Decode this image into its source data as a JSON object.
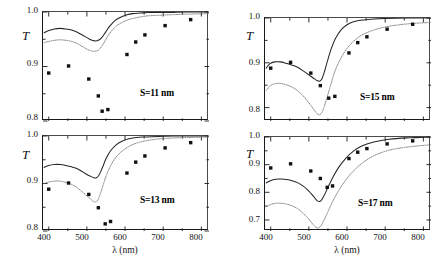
{
  "figure": {
    "axis_titles": {
      "y": "T",
      "x": "λ (nm)"
    },
    "panels": [
      {
        "id": "s11",
        "annotation": "S=11 nm",
        "xlim": [
          385,
          820
        ],
        "ylim": [
          0.8,
          1.0
        ],
        "yticks": [
          0.8,
          0.9,
          1.0
        ],
        "ytick_labels": [
          "0.8",
          "0.9",
          "1.0"
        ],
        "xticks": [
          400,
          450,
          500,
          550,
          600,
          650,
          700,
          750,
          800
        ],
        "xtick_labels": [
          "400",
          "",
          "500",
          "",
          "600",
          "",
          "700",
          "",
          "800"
        ],
        "show_xlabels": false
      },
      {
        "id": "s15",
        "annotation": "S=15 nm",
        "xlim": [
          385,
          820
        ],
        "ylim": [
          0.77,
          1.0
        ],
        "yticks": [
          0.8,
          0.9,
          1.0
        ],
        "ytick_labels": [
          "0.8",
          "0.9",
          "1.0"
        ],
        "xticks": [
          400,
          450,
          500,
          550,
          600,
          650,
          700,
          750,
          800
        ],
        "xtick_labels": [
          "400",
          "",
          "500",
          "",
          "600",
          "",
          "700",
          "",
          "800"
        ],
        "show_xlabels": false
      },
      {
        "id": "s13",
        "annotation": "S=13 nm",
        "xlim": [
          385,
          820
        ],
        "ylim": [
          0.8,
          1.0
        ],
        "yticks": [
          0.8,
          0.9,
          1.0
        ],
        "ytick_labels": [
          "0.8",
          "0.9",
          "1.0"
        ],
        "xticks": [
          400,
          450,
          500,
          550,
          600,
          650,
          700,
          750,
          800
        ],
        "xtick_labels": [
          "400",
          "",
          "500",
          "",
          "600",
          "",
          "700",
          "",
          "800"
        ],
        "show_xlabels": true
      },
      {
        "id": "s17",
        "annotation": "S=17 nm",
        "xlim": [
          385,
          820
        ],
        "ylim": [
          0.66,
          1.0
        ],
        "yticks": [
          0.7,
          0.8,
          0.9,
          1.0
        ],
        "ytick_labels": [
          "0.7",
          "0.8",
          "0.9",
          "1.0"
        ],
        "xticks": [
          400,
          450,
          500,
          550,
          600,
          650,
          700,
          750,
          800
        ],
        "xtick_labels": [
          "400",
          "",
          "500",
          "",
          "600",
          "",
          "700",
          "",
          "800"
        ],
        "show_xlabels": true
      }
    ]
  },
  "chart_data": [
    {
      "type": "line",
      "id": "s11",
      "title": "S=11 nm",
      "xlabel": "λ (nm)",
      "ylabel": "T",
      "xlim": [
        385,
        820
      ],
      "ylim": [
        0.8,
        1.0
      ],
      "grid": false,
      "legend": "none",
      "series": [
        {
          "name": "theory-solid",
          "style": "solid",
          "color": "#262626",
          "x": [
            388,
            400,
            415,
            430,
            445,
            460,
            475,
            490,
            500,
            510,
            520,
            530,
            540,
            550,
            560,
            575,
            590,
            605,
            620,
            640,
            660,
            690,
            720,
            760,
            820
          ],
          "y": [
            0.962,
            0.966,
            0.969,
            0.97,
            0.969,
            0.967,
            0.963,
            0.957,
            0.953,
            0.949,
            0.947,
            0.948,
            0.954,
            0.964,
            0.974,
            0.985,
            0.991,
            0.995,
            0.997,
            0.998,
            0.999,
            0.999,
            0.999,
            1.0,
            1.0
          ]
        },
        {
          "name": "theory-dotted",
          "style": "dotted",
          "color": "#707070",
          "x": [
            388,
            400,
            415,
            430,
            445,
            460,
            475,
            490,
            500,
            510,
            520,
            530,
            540,
            550,
            560,
            575,
            590,
            605,
            620,
            640,
            660,
            690,
            720,
            760,
            820
          ],
          "y": [
            0.944,
            0.946,
            0.948,
            0.949,
            0.948,
            0.946,
            0.942,
            0.936,
            0.932,
            0.929,
            0.928,
            0.93,
            0.938,
            0.95,
            0.961,
            0.973,
            0.98,
            0.985,
            0.988,
            0.991,
            0.993,
            0.994,
            0.995,
            0.996,
            0.997
          ]
        },
        {
          "name": "experiment-points",
          "style": "markers",
          "marker": "square",
          "color": "#111111",
          "x": [
            400,
            452,
            505,
            530,
            540,
            555,
            605,
            628,
            652,
            705,
            772
          ],
          "y": [
            0.888,
            0.901,
            0.877,
            0.846,
            0.818,
            0.821,
            0.922,
            0.945,
            0.958,
            0.975,
            0.986
          ]
        }
      ]
    },
    {
      "type": "line",
      "id": "s15",
      "title": "S=15 nm",
      "xlabel": "λ (nm)",
      "ylabel": "T",
      "xlim": [
        385,
        820
      ],
      "ylim": [
        0.77,
        1.0
      ],
      "grid": false,
      "legend": "none",
      "series": [
        {
          "name": "theory-solid",
          "style": "solid",
          "color": "#262626",
          "x": [
            388,
            398,
            410,
            425,
            440,
            455,
            470,
            485,
            495,
            505,
            515,
            522,
            528,
            534,
            540,
            548,
            558,
            570,
            585,
            600,
            615,
            635,
            660,
            700,
            760,
            820
          ],
          "y": [
            0.888,
            0.898,
            0.902,
            0.902,
            0.899,
            0.895,
            0.89,
            0.882,
            0.876,
            0.87,
            0.864,
            0.86,
            0.859,
            0.864,
            0.878,
            0.902,
            0.93,
            0.955,
            0.974,
            0.985,
            0.991,
            0.995,
            0.997,
            0.999,
            1.0,
            1.0
          ]
        },
        {
          "name": "theory-dotted",
          "style": "dotted",
          "color": "#707070",
          "x": [
            388,
            398,
            410,
            425,
            440,
            455,
            470,
            485,
            495,
            505,
            515,
            522,
            528,
            534,
            540,
            548,
            558,
            570,
            585,
            600,
            615,
            635,
            660,
            700,
            760,
            820
          ],
          "y": [
            0.838,
            0.848,
            0.853,
            0.854,
            0.851,
            0.846,
            0.838,
            0.826,
            0.816,
            0.805,
            0.793,
            0.786,
            0.784,
            0.789,
            0.802,
            0.824,
            0.853,
            0.885,
            0.912,
            0.932,
            0.946,
            0.96,
            0.97,
            0.98,
            0.987,
            0.99
          ]
        },
        {
          "name": "experiment-points",
          "style": "markers",
          "marker": "square",
          "color": "#111111",
          "x": [
            400,
            452,
            505,
            530,
            552,
            568,
            605,
            628,
            652,
            705,
            772
          ],
          "y": [
            0.888,
            0.901,
            0.877,
            0.849,
            0.821,
            0.825,
            0.922,
            0.945,
            0.958,
            0.975,
            0.986
          ]
        }
      ]
    },
    {
      "type": "line",
      "id": "s13",
      "title": "S=13 nm",
      "xlabel": "λ (nm)",
      "ylabel": "T",
      "xlim": [
        385,
        820
      ],
      "ylim": [
        0.8,
        1.0
      ],
      "grid": false,
      "legend": "none",
      "series": [
        {
          "name": "theory-solid",
          "style": "solid",
          "color": "#262626",
          "x": [
            388,
            400,
            415,
            430,
            445,
            460,
            475,
            490,
            500,
            510,
            518,
            525,
            532,
            540,
            550,
            562,
            576,
            592,
            610,
            630,
            655,
            690,
            730,
            780,
            820
          ],
          "y": [
            0.934,
            0.938,
            0.94,
            0.94,
            0.938,
            0.935,
            0.931,
            0.924,
            0.919,
            0.915,
            0.912,
            0.912,
            0.918,
            0.932,
            0.952,
            0.969,
            0.981,
            0.989,
            0.994,
            0.997,
            0.998,
            0.999,
            1.0,
            1.0,
            1.0
          ]
        },
        {
          "name": "theory-dotted",
          "style": "dotted",
          "color": "#707070",
          "x": [
            388,
            400,
            415,
            430,
            445,
            460,
            475,
            490,
            500,
            510,
            518,
            525,
            532,
            540,
            550,
            562,
            576,
            592,
            610,
            630,
            655,
            690,
            730,
            780,
            820
          ],
          "y": [
            0.9,
            0.903,
            0.905,
            0.905,
            0.902,
            0.898,
            0.891,
            0.881,
            0.874,
            0.867,
            0.862,
            0.862,
            0.871,
            0.89,
            0.915,
            0.937,
            0.955,
            0.968,
            0.978,
            0.985,
            0.99,
            0.994,
            0.996,
            0.997,
            0.998
          ]
        },
        {
          "name": "experiment-points",
          "style": "markers",
          "marker": "square",
          "color": "#111111",
          "x": [
            400,
            452,
            505,
            530,
            548,
            562,
            605,
            628,
            652,
            705,
            772
          ],
          "y": [
            0.888,
            0.901,
            0.877,
            0.849,
            0.815,
            0.82,
            0.922,
            0.945,
            0.958,
            0.975,
            0.986
          ]
        }
      ]
    },
    {
      "type": "line",
      "id": "s17",
      "title": "S=17 nm",
      "xlabel": "λ (nm)",
      "ylabel": "T",
      "xlim": [
        385,
        820
      ],
      "ylim": [
        0.66,
        1.0
      ],
      "grid": false,
      "legend": "none",
      "series": [
        {
          "name": "theory-solid",
          "style": "solid",
          "color": "#262626",
          "x": [
            388,
            398,
            412,
            428,
            442,
            456,
            470,
            484,
            496,
            506,
            514,
            520,
            526,
            532,
            540,
            550,
            562,
            578,
            596,
            616,
            640,
            670,
            710,
            760,
            820
          ],
          "y": [
            0.834,
            0.841,
            0.847,
            0.848,
            0.846,
            0.842,
            0.835,
            0.823,
            0.81,
            0.795,
            0.782,
            0.772,
            0.767,
            0.77,
            0.788,
            0.818,
            0.852,
            0.89,
            0.922,
            0.948,
            0.968,
            0.982,
            0.992,
            0.997,
            1.0
          ]
        },
        {
          "name": "theory-dotted",
          "style": "dotted",
          "color": "#707070",
          "x": [
            388,
            398,
            412,
            428,
            442,
            456,
            470,
            484,
            496,
            506,
            514,
            520,
            526,
            532,
            540,
            550,
            562,
            578,
            596,
            616,
            640,
            670,
            710,
            760,
            820
          ],
          "y": [
            0.748,
            0.755,
            0.76,
            0.76,
            0.757,
            0.751,
            0.741,
            0.725,
            0.709,
            0.692,
            0.679,
            0.672,
            0.672,
            0.68,
            0.7,
            0.73,
            0.766,
            0.806,
            0.843,
            0.876,
            0.906,
            0.932,
            0.952,
            0.964,
            0.972
          ]
        },
        {
          "name": "experiment-points",
          "style": "markers",
          "marker": "square",
          "color": "#111111",
          "x": [
            400,
            452,
            505,
            530,
            548,
            562,
            605,
            628,
            652,
            705,
            772
          ],
          "y": [
            0.888,
            0.903,
            0.877,
            0.85,
            0.818,
            0.823,
            0.922,
            0.945,
            0.958,
            0.975,
            0.986
          ]
        }
      ]
    }
  ]
}
